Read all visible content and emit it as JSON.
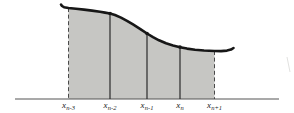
{
  "figure": {
    "axis_labels": [
      {
        "base": "x",
        "sub": "n-3"
      },
      {
        "base": "x",
        "sub": "n-2"
      },
      {
        "base": "x",
        "sub": "n-1"
      },
      {
        "base": "x",
        "sub": "n"
      },
      {
        "base": "x",
        "sub": "n+1"
      }
    ],
    "colors": {
      "background": "#ffffff",
      "shaded_region": "#c6c6c3",
      "curve": "#171717",
      "ordinate_line": "#2b2b2b",
      "dashed_boundary": "#4a4a4a",
      "axis": "#555555",
      "label_text": "#222222",
      "artifact": "#e2e2e0"
    },
    "geometry": {
      "width": 294,
      "height": 113,
      "axis_y": 99,
      "axis_x1": 15,
      "axis_x2": 279,
      "ordinates_x": [
        68.5,
        110,
        147,
        180,
        214.5
      ],
      "ordinate_top_y": [
        8,
        13.5,
        33.5,
        47,
        51
      ],
      "dashed_boundary_indices": [
        0,
        4
      ],
      "solid_ordinate_indices": [
        1,
        2,
        3
      ],
      "dot_radius": 1.8,
      "curve_stroke_width": 2.6,
      "curve_points": [
        [
          61,
          4.5
        ],
        [
          62,
          6
        ],
        [
          64,
          7.2
        ],
        [
          68.5,
          8
        ],
        [
          76,
          8.8
        ],
        [
          84,
          9.6
        ],
        [
          92,
          10.6
        ],
        [
          100,
          11.8
        ],
        [
          105,
          12.6
        ],
        [
          110,
          13.5
        ],
        [
          115,
          15
        ],
        [
          121,
          17.6
        ],
        [
          127,
          20.8
        ],
        [
          133,
          24.4
        ],
        [
          140,
          28.8
        ],
        [
          147,
          33.5
        ],
        [
          153,
          37.2
        ],
        [
          159,
          40.3
        ],
        [
          166,
          43.3
        ],
        [
          173,
          45.5
        ],
        [
          180,
          47.2
        ],
        [
          187,
          48.6
        ],
        [
          195,
          49.7
        ],
        [
          204,
          50.5
        ],
        [
          214.5,
          51
        ],
        [
          221,
          51.1
        ],
        [
          227,
          50.6
        ],
        [
          231,
          49.6
        ],
        [
          233.5,
          48
        ]
      ],
      "label_y": 100,
      "artifact_line": [
        287,
        57,
        290,
        72
      ]
    }
  }
}
